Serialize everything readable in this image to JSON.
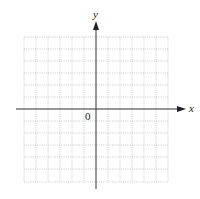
{
  "diagram": {
    "type": "coordinate-grid",
    "x_axis_label": "x",
    "y_axis_label": "y",
    "origin_label": "0",
    "grid": {
      "columns": 12,
      "rows": 12,
      "cells_left_of_y_axis": 6,
      "cells_above_x_axis": 6,
      "line_style": "dotted",
      "line_color": "#b8b8b8",
      "axis_color": "#333333"
    }
  }
}
